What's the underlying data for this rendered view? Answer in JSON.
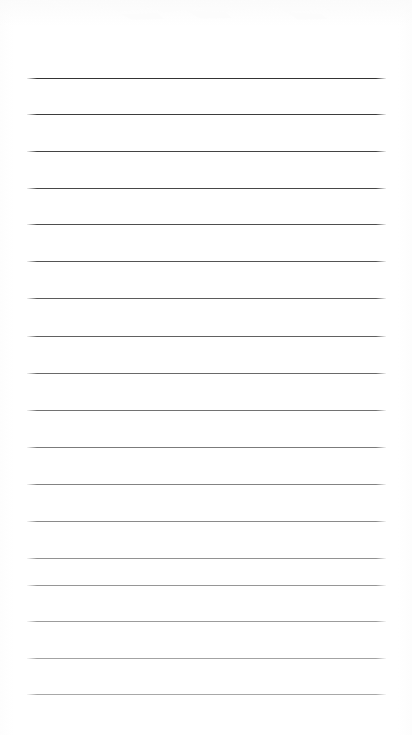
{
  "document": {
    "kind": "scanned-ruled-notepad-page",
    "title": "Blank Ruled Notepad Page",
    "page_width": 412,
    "page_height": 735,
    "background_color": "#ffffff",
    "content_text": "",
    "has_handwriting": false,
    "has_printed_text": false,
    "orientation": "portrait"
  },
  "ruling": {
    "line_count": 18,
    "first_line_y": 78,
    "line_spacing": 36.2,
    "line_start_x": 27,
    "line_end_x": 386,
    "line_length": 359,
    "left_margin": 27,
    "right_margin": 26,
    "top_margin": 78,
    "bottom_margin": 41,
    "thickness": 1,
    "style": "solid",
    "darkest_color": "#333333",
    "lightest_color": "#9a9a9a",
    "fade_direction": "top-dark-to-bottom-light"
  },
  "lines": [
    {
      "index": 1,
      "y": 78,
      "x1": 27,
      "x2": 386,
      "color": "#343434",
      "opacity": 1.0,
      "text": ""
    },
    {
      "index": 2,
      "y": 114,
      "x1": 27,
      "x2": 386,
      "color": "#3a3a3a",
      "opacity": 0.98,
      "text": ""
    },
    {
      "index": 3,
      "y": 151,
      "x1": 27,
      "x2": 386,
      "color": "#3d3d3d",
      "opacity": 0.97,
      "text": ""
    },
    {
      "index": 4,
      "y": 188,
      "x1": 27,
      "x2": 386,
      "color": "#414141",
      "opacity": 0.96,
      "text": ""
    },
    {
      "index": 5,
      "y": 224,
      "x1": 27,
      "x2": 386,
      "color": "#454545",
      "opacity": 0.95,
      "text": ""
    },
    {
      "index": 6,
      "y": 261,
      "x1": 27,
      "x2": 386,
      "color": "#4a4a4a",
      "opacity": 0.94,
      "text": ""
    },
    {
      "index": 7,
      "y": 298,
      "x1": 27,
      "x2": 386,
      "color": "#4f4f4f",
      "opacity": 0.93,
      "text": ""
    },
    {
      "index": 8,
      "y": 336,
      "x1": 27,
      "x2": 386,
      "color": "#545454",
      "opacity": 0.92,
      "text": ""
    },
    {
      "index": 9,
      "y": 373,
      "x1": 27,
      "x2": 386,
      "color": "#5b5b5b",
      "opacity": 0.91,
      "text": ""
    },
    {
      "index": 10,
      "y": 410,
      "x1": 27,
      "x2": 386,
      "color": "#636363",
      "opacity": 0.9,
      "text": ""
    },
    {
      "index": 11,
      "y": 447,
      "x1": 27,
      "x2": 386,
      "color": "#6b6b6b",
      "opacity": 0.89,
      "text": ""
    },
    {
      "index": 12,
      "y": 484,
      "x1": 27,
      "x2": 386,
      "color": "#737373",
      "opacity": 0.88,
      "text": ""
    },
    {
      "index": 13,
      "y": 521,
      "x1": 27,
      "x2": 386,
      "color": "#7b7b7b",
      "opacity": 0.88,
      "text": ""
    },
    {
      "index": 14,
      "y": 558,
      "x1": 27,
      "x2": 386,
      "color": "#828282",
      "opacity": 0.87,
      "text": ""
    },
    {
      "index": 15,
      "y": 585,
      "x1": 27,
      "x2": 386,
      "color": "#878787",
      "opacity": 0.87,
      "text": ""
    },
    {
      "index": 16,
      "y": 621,
      "x1": 27,
      "x2": 386,
      "color": "#8c8c8c",
      "opacity": 0.86,
      "text": ""
    },
    {
      "index": 17,
      "y": 658,
      "x1": 27,
      "x2": 386,
      "color": "#949494",
      "opacity": 0.86,
      "text": ""
    },
    {
      "index": 18,
      "y": 694,
      "x1": 27,
      "x2": 386,
      "color": "#9a9a9a",
      "opacity": 0.85,
      "text": ""
    }
  ],
  "scan_artifacts": {
    "present": true,
    "region": "top-edge",
    "y_range": [
      0,
      22
    ],
    "color": "#fdfdfd",
    "description": "near-white smudge band from scanner lid edge"
  }
}
